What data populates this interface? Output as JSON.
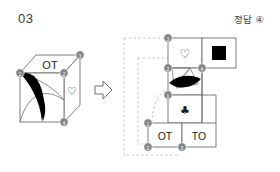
{
  "header": {
    "question_number": "03",
    "answer_label": "정답 ④"
  },
  "figure": {
    "caption_cube": "cube-with-markings",
    "caption_net": "unfolded-cube-net",
    "arrow": "right-arrow"
  },
  "cube": {
    "faces": [
      {
        "name": "top-face",
        "label": "OT"
      },
      {
        "name": "right-face",
        "label": "♡"
      },
      {
        "name": "front-face",
        "label": ""
      }
    ],
    "vertices": [
      {
        "id": "1",
        "label": "1"
      },
      {
        "id": "2",
        "label": "2"
      },
      {
        "id": "3",
        "label": "3"
      },
      {
        "id": "4",
        "label": "4"
      }
    ]
  },
  "net": {
    "cells": [
      {
        "name": "net-cell-heart",
        "label": "♡",
        "row": 1,
        "col": 2
      },
      {
        "name": "net-cell-black-square",
        "label": "■",
        "row": 1,
        "col": 3
      },
      {
        "name": "net-cell-leaf",
        "label": "",
        "row": 2,
        "col": 2
      },
      {
        "name": "net-cell-club",
        "label": "♣",
        "row": 3,
        "col": 2
      },
      {
        "name": "net-cell-ot",
        "label": "OT",
        "row": 4,
        "col": 1
      },
      {
        "name": "net-cell-to",
        "label": "TO",
        "row": 4,
        "col": 2
      }
    ],
    "vertices": [
      {
        "id": "3",
        "label": "3"
      },
      {
        "id": "2",
        "label": "2"
      },
      {
        "id": "4",
        "label": "4"
      },
      {
        "id": "1",
        "label": "1"
      },
      {
        "id": "1b",
        "label": "1"
      },
      {
        "id": "2b",
        "label": "2"
      },
      {
        "id": "3b",
        "label": "3"
      }
    ]
  },
  "colors": {
    "ink": "#231f20",
    "line": "#6d6e71",
    "dashed": "#b7b7b7",
    "node_fill": "#808285",
    "fill_black": "#000000",
    "paper": "#ffffff"
  }
}
